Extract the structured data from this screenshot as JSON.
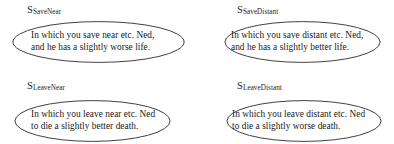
{
  "diagram": {
    "type": "scenario-grid",
    "columns": 2,
    "rows": 2,
    "stroke_color": "#2b2b2b",
    "text_color": "#181818",
    "background_color": "#ffffff",
    "scenarios": [
      {
        "id": "save-near",
        "label_symbol": "S",
        "label_subscript": "SaveNear",
        "lines": [
          "In which you save near etc. Ned,",
          "and he has a slightly worse life."
        ]
      },
      {
        "id": "save-distant",
        "label_symbol": "S",
        "label_subscript": "SaveDistant",
        "lines": [
          "In which you save distant etc. Ned,",
          "and he has a slightly better life."
        ]
      },
      {
        "id": "leave-near",
        "label_symbol": "S",
        "label_subscript": "LeaveNear",
        "lines": [
          "In which you leave near etc. Ned",
          "to die a slightly better death."
        ]
      },
      {
        "id": "leave-distant",
        "label_symbol": "S",
        "label_subscript": "LeaveDistant",
        "lines": [
          "In which you leave distant etc. Ned",
          "to die a slightly worse death."
        ]
      }
    ]
  }
}
